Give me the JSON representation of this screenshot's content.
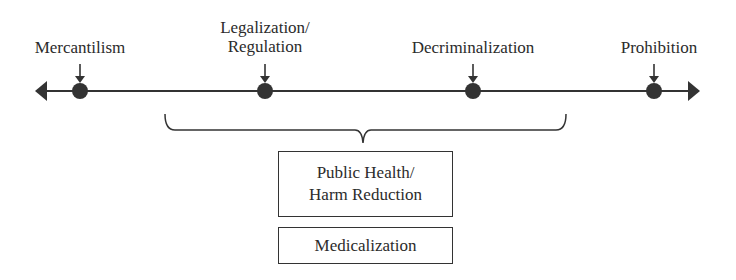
{
  "spectrum": {
    "points": [
      {
        "label_line1": "Mercantilism",
        "label_line2": ""
      },
      {
        "label_line1": "Legalization/",
        "label_line2": "Regulation"
      },
      {
        "label_line1": "Decriminalization",
        "label_line2": ""
      },
      {
        "label_line1": "Prohibition",
        "label_line2": ""
      }
    ]
  },
  "brace_boxes": [
    {
      "line1": "Public Health/",
      "line2": "Harm Reduction"
    },
    {
      "line1": "Medicalization",
      "line2": ""
    }
  ],
  "colors": {
    "ink": "#2b2b2b",
    "background": "#ffffff"
  }
}
